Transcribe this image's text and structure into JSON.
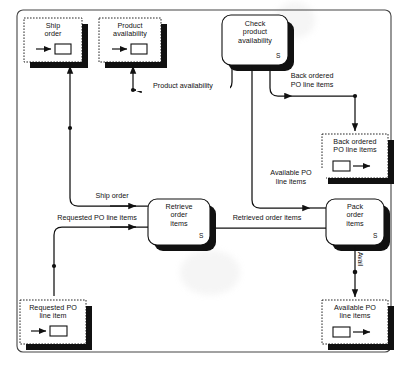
{
  "diagram": {
    "type": "data-flow-diagram",
    "title": "",
    "caption": "",
    "colors": {
      "stroke": "#111111",
      "shadow": "#111111",
      "background": "#ffffff",
      "border": "#3a3a3a"
    },
    "outer_frame": {
      "label": "diagram-frame"
    },
    "datastores": [
      {
        "id": "ship-order",
        "label": "Ship\norder",
        "icon": "arrow-into-box-icon",
        "direction": "in",
        "x": 24,
        "y": 18,
        "w": 58,
        "h": 44
      },
      {
        "id": "product-availability",
        "label": "Product\navailability",
        "icon": "arrow-into-box-icon",
        "direction": "in",
        "x": 99,
        "y": 18,
        "w": 62,
        "h": 44
      },
      {
        "id": "back-ordered-po-line-items",
        "label": "Back ordered\nPO line items",
        "icon": "box-into-arrow-icon",
        "direction": "out",
        "x": 322,
        "y": 134,
        "w": 66,
        "h": 44
      },
      {
        "id": "available-po-line-items",
        "label": "Available PO\nline items",
        "icon": "box-into-arrow-icon",
        "direction": "out",
        "x": 322,
        "y": 300,
        "w": 66,
        "h": 44
      },
      {
        "id": "requested-po-line-item",
        "label": "Requested PO\nline item",
        "icon": "arrow-into-box-icon",
        "direction": "in",
        "x": 20,
        "y": 300,
        "w": 66,
        "h": 44
      }
    ],
    "processes": [
      {
        "id": "check-product-availability",
        "label": "Check\nproduct\navailability",
        "marker": "S",
        "x": 222,
        "y": 15,
        "w": 66,
        "h": 50
      },
      {
        "id": "retrieve-order-items",
        "label": "Retrieve\norder\nitems",
        "marker": "S",
        "x": 148,
        "y": 199,
        "w": 62,
        "h": 46
      },
      {
        "id": "pack-order-items",
        "label": "Pack\norder\nitems",
        "marker": "S",
        "x": 326,
        "y": 199,
        "w": 58,
        "h": 46
      }
    ],
    "flows": [
      {
        "id": "flow-product-availability",
        "label": "Product availability",
        "from": "check-product-availability",
        "to": "product-availability"
      },
      {
        "id": "flow-back-ordered",
        "label": "Back ordered\nPO line items",
        "from": "check-product-availability",
        "to": "back-ordered-po-line-items"
      },
      {
        "id": "flow-available-po",
        "label": "Available PO\nline items",
        "from": "check-product-availability",
        "to": "pack-order-items"
      },
      {
        "id": "flow-ship-order",
        "label": "Ship order",
        "from": "retrieve-order-items",
        "to": "ship-order"
      },
      {
        "id": "flow-requested-po",
        "label": "Requested PO line items",
        "from": "requested-po-line-item",
        "to": "retrieve-order-items"
      },
      {
        "id": "flow-retrieved-order-items",
        "label": "Retrieved order items",
        "from": "retrieve-order-items",
        "to": "pack-order-items"
      },
      {
        "id": "flow-avail",
        "label": "Avail",
        "from": "pack-order-items",
        "to": "available-po-line-items",
        "orientation": "vertical"
      }
    ]
  }
}
